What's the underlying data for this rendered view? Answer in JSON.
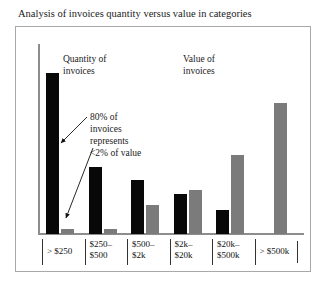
{
  "page": {
    "title": "Analysis of invoices quantity versus value in categories"
  },
  "labels": {
    "quantity_series": "Quantity of\ninvoices",
    "quantity_series_line1": "Quantity of",
    "quantity_series_line2": "invoices",
    "value_series_line1": "Value of",
    "value_series_line2": "invoices",
    "annotation_line1": "80% of",
    "annotation_line2": "invoices",
    "annotation_line3": "represents",
    "annotation_line4": "<2% of value"
  },
  "colors": {
    "quantity_bar": "#080808",
    "value_bar": "#7b7b7b",
    "axis": "#8d8d8d",
    "frame": "#a8a8a8",
    "text": "#1a1a1a"
  },
  "chart_data": {
    "type": "bar",
    "title": "Analysis of invoices quantity versus value in categories",
    "xlabel": "",
    "ylabel": "",
    "grid": false,
    "legend_position": "inline-annotations",
    "categories": [
      "> $250",
      "$250–$500",
      "$500–$2k",
      "$2k–$20k",
      "$20k–$500k",
      "> $500k"
    ],
    "category_lines": [
      [
        "> $250"
      ],
      [
        "$250–",
        "$500"
      ],
      [
        "$500–",
        "$2k"
      ],
      [
        "$2k–",
        "$20k"
      ],
      [
        "$20k–",
        "$500k"
      ],
      [
        "> $500k"
      ]
    ],
    "series": [
      {
        "name": "Quantity of invoices",
        "color": "#080808",
        "values": [
          96,
          40,
          32,
          24,
          14,
          0
        ]
      },
      {
        "name": "Value of invoices",
        "color": "#7b7b7b",
        "values": [
          3,
          3,
          17,
          26,
          47,
          78
        ]
      }
    ],
    "ylim": [
      0,
      100
    ],
    "annotations": [
      {
        "text": "80% of invoices represents <2% of value",
        "targets": [
          "quantity-bar-1",
          "value-bar-2"
        ]
      }
    ]
  }
}
